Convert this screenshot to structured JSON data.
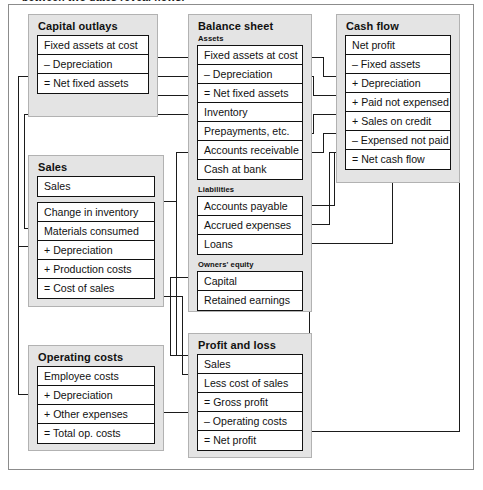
{
  "caption": "between two dates reveal flows.",
  "diagram": {
    "colors": {
      "panel_fill": "#e4e4e4",
      "panel_border": "#b2b2b2",
      "row_fill": "#ffffff",
      "row_border": "#111111",
      "connector": "#1b1b1b",
      "frame": "#8c8c8c"
    },
    "panels": [
      {
        "id": "capital-outlays",
        "title": "Capital outlays",
        "rows": [
          "Fixed assets at cost",
          "– Depreciation",
          "= Net fixed assets"
        ]
      },
      {
        "id": "sales",
        "title": "Sales",
        "rows_a": [
          "Sales"
        ],
        "rows_b": [
          "Change in inventory",
          "Materials consumed",
          "+ Depreciation",
          "+ Production costs",
          "= Cost of sales"
        ]
      },
      {
        "id": "operating-costs",
        "title": "Operating costs",
        "rows": [
          "Employee costs",
          "+ Depreciation",
          "+ Other expenses",
          "= Total op. costs"
        ]
      },
      {
        "id": "balance-sheet",
        "title": "Balance sheet",
        "sections": [
          {
            "label": "Assets",
            "rows": [
              "Fixed assets at cost",
              "– Depreciation",
              "= Net fixed assets",
              "Inventory",
              "Prepayments, etc.",
              "Accounts receivable",
              "Cash at bank"
            ]
          },
          {
            "label": "Liabilities",
            "rows": [
              "Accounts payable",
              "Accrued expenses",
              "Loans"
            ]
          },
          {
            "label": "Owners' equity",
            "rows": [
              "Capital",
              "Retained earnings"
            ]
          }
        ]
      },
      {
        "id": "cash-flow",
        "title": "Cash flow",
        "rows": [
          "Net profit",
          "– Fixed assets",
          "+ Depreciation",
          "+ Paid not expensed",
          "+ Sales on credit",
          "– Expensed not paid",
          "= Net cash flow"
        ]
      },
      {
        "id": "profit-and-loss",
        "title": "Profit and loss",
        "rows": [
          "Sales",
          "Less cost of sales",
          "= Gross profit",
          "– Operating costs",
          "= Net profit"
        ]
      }
    ],
    "connectors": [
      {
        "from": "capital-outlays.Fixed assets at cost",
        "to": "balance-sheet.Fixed assets at cost"
      },
      {
        "from": "capital-outlays.– Depreciation",
        "to": "balance-sheet.– Depreciation"
      },
      {
        "from": "capital-outlays.= Net fixed assets",
        "to": "balance-sheet.= Net fixed assets"
      },
      {
        "from": "capital-outlays.– Depreciation",
        "to": "sales.+ Depreciation"
      },
      {
        "from": "capital-outlays.– Depreciation",
        "to": "operating-costs.+ Depreciation"
      },
      {
        "from": "sales.Change in inventory",
        "to": "balance-sheet.Inventory"
      },
      {
        "from": "sales.Sales",
        "to": "balance-sheet.Accounts receivable"
      },
      {
        "from": "sales.Sales",
        "to": "profit-and-loss.Sales"
      },
      {
        "from": "sales.= Cost of sales",
        "to": "profit-and-loss.Less cost of sales"
      },
      {
        "from": "operating-costs.= Total op. costs",
        "to": "profit-and-loss.– Operating costs"
      },
      {
        "from": "balance-sheet.Fixed assets at cost",
        "to": "cash-flow.– Fixed assets"
      },
      {
        "from": "balance-sheet.– Depreciation",
        "to": "cash-flow.+ Depreciation"
      },
      {
        "from": "balance-sheet.Prepayments, etc.",
        "to": "cash-flow.+ Paid not expensed"
      },
      {
        "from": "balance-sheet.Accounts receivable",
        "to": "cash-flow.+ Sales on credit"
      },
      {
        "from": "balance-sheet.Accounts payable",
        "to": "cash-flow.– Expensed not paid"
      },
      {
        "from": "balance-sheet.Accrued expenses",
        "to": "cash-flow.– Expensed not paid"
      },
      {
        "from": "cash-flow.= Net cash flow",
        "to": "balance-sheet.Loans"
      },
      {
        "from": "profit-and-loss.= Net profit",
        "to": "cash-flow.Net profit"
      },
      {
        "from": "profit-and-loss.= Net profit",
        "to": "balance-sheet.Retained earnings"
      },
      {
        "from": "balance-sheet.Capital",
        "to": "profit-and-loss.Sales"
      }
    ]
  }
}
